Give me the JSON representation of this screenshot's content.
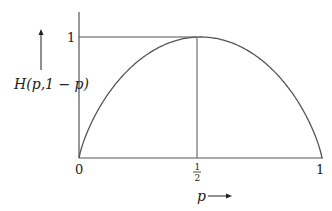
{
  "chart_data": {
    "type": "line",
    "title": "",
    "xlabel": "p",
    "ylabel": "H(p,1 − p)",
    "x_ticks": [
      "0",
      "1/2",
      "1"
    ],
    "y_ticks": [
      "1"
    ],
    "xlim": [
      0,
      1
    ],
    "ylim": [
      0,
      1
    ],
    "grid": false,
    "legend": null,
    "series": [
      {
        "name": "H(p,1-p)",
        "x": [
          0,
          0.05,
          0.1,
          0.2,
          0.3,
          0.4,
          0.5,
          0.6,
          0.7,
          0.8,
          0.9,
          0.95,
          1
        ],
        "values": [
          0,
          0.286,
          0.469,
          0.722,
          0.881,
          0.971,
          1,
          0.971,
          0.881,
          0.722,
          0.469,
          0.286,
          0
        ]
      }
    ],
    "annotations": [
      {
        "type": "hline",
        "y": 1,
        "x_from": 0,
        "x_to": 0.5
      },
      {
        "type": "vline",
        "x": 0.5,
        "y_from": 0,
        "y_to": 1
      }
    ]
  },
  "labels": {
    "ylabel_main": "H(p,1 − p)",
    "xlabel_main": "p",
    "ytick_1": "1",
    "xtick_0": "0",
    "xtick_half_num": "1",
    "xtick_half_den": "2",
    "xtick_1": "1"
  },
  "colors": {
    "line": "#555555",
    "text": "#222222"
  }
}
